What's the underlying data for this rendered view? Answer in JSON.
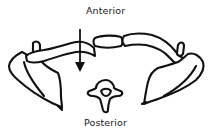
{
  "diagram": {
    "labels": {
      "top": "Anterior",
      "bottom": "Posterior"
    },
    "arrow": {
      "direction": "down",
      "meaning": "anterior-to-posterior"
    },
    "structures": [
      "left-scapula",
      "left-clavicle",
      "manubrium",
      "right-clavicle",
      "right-scapula",
      "vertebra"
    ],
    "colors": {
      "stroke": "#111111",
      "fill": "#ffffff"
    }
  }
}
